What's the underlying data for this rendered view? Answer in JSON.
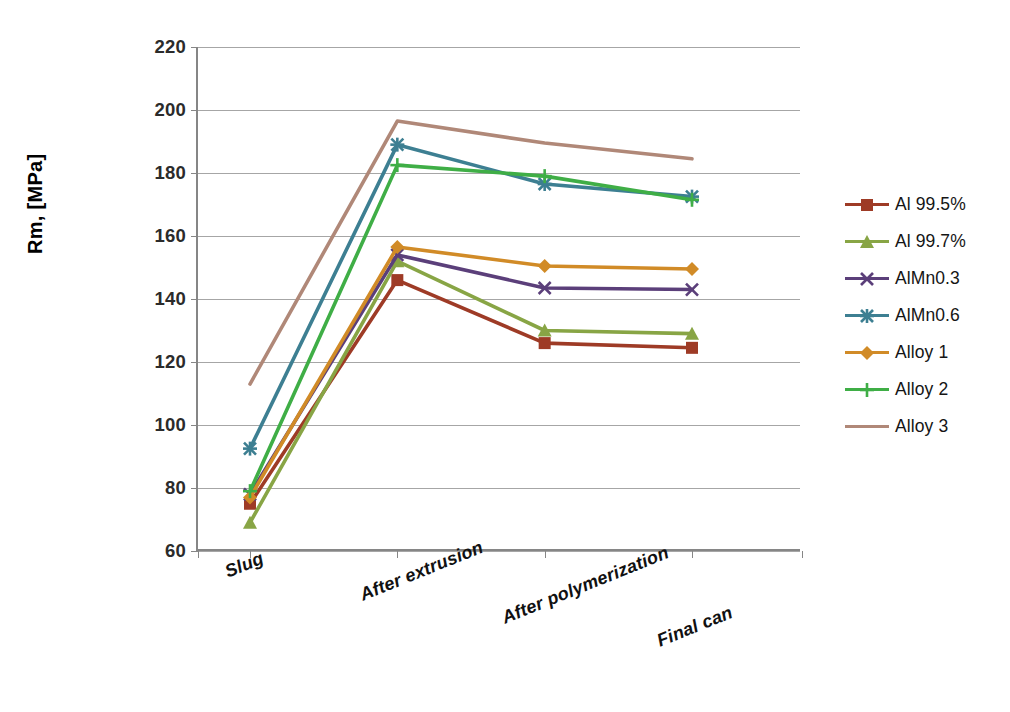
{
  "chart_data": {
    "type": "line",
    "title": "",
    "xlabel": "",
    "ylabel": "Rm, [MPa]",
    "categories": [
      "Slug",
      "After extrusion",
      "After polymerization",
      "Final can"
    ],
    "ylim": [
      60,
      220
    ],
    "yticks": [
      60,
      80,
      100,
      120,
      140,
      160,
      180,
      200,
      220
    ],
    "grid": true,
    "legend_position": "right",
    "series": [
      {
        "name": "Al 99.5%",
        "color": "#9e3b26",
        "marker": "square",
        "values": [
          75,
          146,
          126,
          124.5
        ]
      },
      {
        "name": "Al 99.7%",
        "color": "#88a545",
        "marker": "triangle",
        "values": [
          69,
          152,
          130,
          129
        ]
      },
      {
        "name": "AlMn0.3",
        "color": "#5b3f7a",
        "marker": "x",
        "values": [
          78,
          154,
          143.5,
          143
        ]
      },
      {
        "name": "AlMn0.6",
        "color": "#3d7f92",
        "marker": "asterisk",
        "values": [
          92.5,
          189,
          176.5,
          172.5
        ]
      },
      {
        "name": "Alloy 1",
        "color": "#d18b27",
        "marker": "diamond",
        "values": [
          77,
          156.5,
          150.5,
          149.5
        ]
      },
      {
        "name": "Alloy 2",
        "color": "#3fae46",
        "marker": "plus",
        "values": [
          79,
          182.5,
          179,
          171.5
        ]
      },
      {
        "name": "Alloy 3",
        "color": "#b08878",
        "marker": "none",
        "values": [
          113,
          196.5,
          189.5,
          184.5
        ]
      }
    ]
  },
  "axis": {
    "y_title": "Rm, [MPa]",
    "y_tick_labels": [
      "220",
      "200",
      "180",
      "160",
      "140",
      "120",
      "100",
      "80",
      "60"
    ]
  },
  "legend": {
    "items": [
      {
        "label": "Al 99.5%"
      },
      {
        "label": "Al 99.7%"
      },
      {
        "label": "AlMn0.3"
      },
      {
        "label": "AlMn0.6"
      },
      {
        "label": "Alloy 1"
      },
      {
        "label": "Alloy 2"
      },
      {
        "label": "Alloy 3"
      }
    ]
  }
}
